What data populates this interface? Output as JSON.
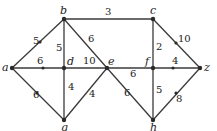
{
  "diagram": {
    "type": "weighted-graph",
    "nodes": [
      {
        "id": "a",
        "label": "a",
        "x": 12,
        "y": 68
      },
      {
        "id": "b",
        "label": "b",
        "x": 64,
        "y": 19
      },
      {
        "id": "c",
        "label": "c",
        "x": 153,
        "y": 19
      },
      {
        "id": "d",
        "label": "d",
        "x": 64,
        "y": 68
      },
      {
        "id": "e",
        "label": "e",
        "x": 107,
        "y": 68
      },
      {
        "id": "f",
        "label": "f",
        "x": 153,
        "y": 68
      },
      {
        "id": "z",
        "label": "z",
        "x": 200,
        "y": 68
      },
      {
        "id": "g",
        "label": "g",
        "x": 64,
        "y": 120
      },
      {
        "id": "h",
        "label": "h",
        "x": 153,
        "y": 120
      }
    ],
    "edges": [
      {
        "from": "a",
        "to": "b",
        "weight": "5"
      },
      {
        "from": "a",
        "to": "d",
        "weight": "6"
      },
      {
        "from": "a",
        "to": "g",
        "weight": "6"
      },
      {
        "from": "b",
        "to": "d",
        "weight": "5"
      },
      {
        "from": "b",
        "to": "e",
        "weight": "6"
      },
      {
        "from": "b",
        "to": "c",
        "weight": "3"
      },
      {
        "from": "d",
        "to": "e",
        "weight": "10"
      },
      {
        "from": "d",
        "to": "g",
        "weight": "4"
      },
      {
        "from": "e",
        "to": "g",
        "weight": "4"
      },
      {
        "from": "e",
        "to": "f",
        "weight": "6"
      },
      {
        "from": "e",
        "to": "h",
        "weight": "6"
      },
      {
        "from": "c",
        "to": "f",
        "weight": "2"
      },
      {
        "from": "c",
        "to": "z",
        "weight": "10"
      },
      {
        "from": "f",
        "to": "z",
        "weight": "4"
      },
      {
        "from": "f",
        "to": "h",
        "weight": "5"
      },
      {
        "from": "h",
        "to": "z",
        "weight": "8"
      }
    ]
  }
}
